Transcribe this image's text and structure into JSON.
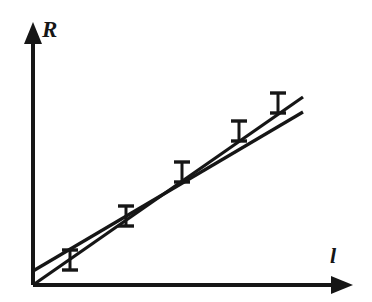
{
  "figure": {
    "title": "",
    "background_color": "#ffffff",
    "ink_color": "#161616",
    "width": 372,
    "height": 302
  },
  "axes": {
    "y": {
      "label": "R",
      "name": "resistance",
      "arrow": true,
      "origin_px": [
        33,
        285
      ],
      "tip_px": [
        33,
        25
      ],
      "ticks": [],
      "tick_labels": []
    },
    "x": {
      "label": "l",
      "name": "length",
      "arrow": true,
      "origin_px": [
        33,
        285
      ],
      "tip_px": [
        352,
        285
      ],
      "ticks": [],
      "tick_labels": []
    }
  },
  "chart_data": {
    "type": "scatter",
    "title": "",
    "subtitle": "",
    "xlabel": "l",
    "ylabel": "R",
    "xlim": [
      0,
      10
    ],
    "ylim": [
      0,
      10
    ],
    "grid": false,
    "legend": null,
    "legend_position": "none",
    "axis_ticks_shown": false,
    "axis_tick_labels_shown": false,
    "annotations": [],
    "series": [
      {
        "name": "measured-points",
        "type": "scatter-with-errorbars",
        "marker": "none",
        "error_bar_style": "vertical-capped",
        "x": [
          1.15,
          3.05,
          4.95,
          6.9,
          8.3
        ],
        "y": [
          1.05,
          2.75,
          4.45,
          6.05,
          7.35
        ],
        "yerr": [
          0.38,
          0.38,
          0.38,
          0.38,
          0.38
        ],
        "points_px": [
          {
            "x": 70,
            "y": 260,
            "err_px": 10
          },
          {
            "x": 126,
            "y": 216,
            "err_px": 10
          },
          {
            "x": 182,
            "y": 172,
            "err_px": 10
          },
          {
            "x": 239,
            "y": 131,
            "err_px": 10
          },
          {
            "x": 278,
            "y": 103,
            "err_px": 10
          }
        ]
      },
      {
        "name": "fit-line-through-origin",
        "type": "line",
        "description": "straight line drawn from the coordinate origin",
        "intercept": 0.0,
        "slope": 0.92,
        "endpoints_px": [
          [
            33,
            285
          ],
          [
            303,
            97
          ]
        ]
      },
      {
        "name": "fit-line-with-intercept",
        "type": "line",
        "description": "straight line with small positive intercept on the R axis",
        "intercept": 0.55,
        "slope": 0.85,
        "endpoints_px": [
          [
            33,
            271
          ],
          [
            303,
            112
          ]
        ]
      }
    ]
  }
}
